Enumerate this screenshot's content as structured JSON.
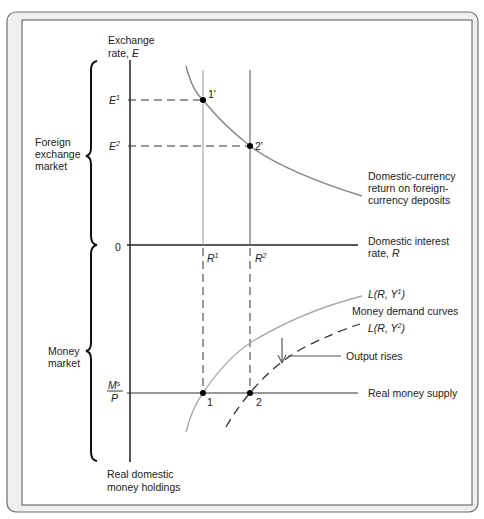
{
  "figure": {
    "colors": {
      "frame_bg": "#efefef",
      "frame_stroke": "#6e6e6e",
      "axis": "#222222",
      "curve_gray": "#8a8a8a",
      "curve_light": "#a9a9a9",
      "dashed": "#333333",
      "point": "#000000"
    },
    "vertical_axis_label": [
      "Exchange",
      "rate, E"
    ],
    "horizontal_axis_label": [
      "Domestic interest",
      "rate, R"
    ],
    "origin_label": "0",
    "bottom_axis_label": [
      "Real domestic",
      "money holdings"
    ],
    "brace_labels": {
      "fx_market": [
        "Foreign",
        "exchange",
        "market"
      ],
      "money_market": [
        "Money",
        "market"
      ]
    },
    "y_ticks": {
      "E1": {
        "base": "E",
        "sup": "1"
      },
      "E2": {
        "base": "E",
        "sup": "2"
      },
      "MsP": {
        "num_base": "M",
        "num_sup": "s",
        "den": "P"
      }
    },
    "x_ticks": {
      "R1": {
        "base": "R",
        "sup": "1"
      },
      "R2": {
        "base": "R",
        "sup": "2"
      }
    },
    "points": {
      "p1prime": "1'",
      "p2prime": "2'",
      "p1": "1",
      "p2": "2"
    },
    "curve_labels": {
      "foreign_return": [
        "Domestic-currency",
        "return on foreign-",
        "currency deposits"
      ],
      "L1": {
        "prefix": "L(R, Y",
        "sup": "1",
        "suffix": ")"
      },
      "L2": {
        "prefix": "L(R, Y",
        "sup": "2",
        "suffix": ")"
      },
      "money_demand": "Money demand curves",
      "output_rises": "Output rises",
      "real_money_supply": "Real money supply"
    }
  }
}
